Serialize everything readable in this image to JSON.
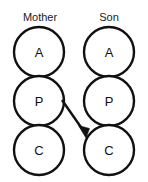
{
  "diagram": {
    "background_color": "#ffffff",
    "stroke_color": "#111111",
    "text_color": "#1a1a1a",
    "columns": [
      {
        "id": "mother",
        "label": "Mother",
        "label_x": 40,
        "label_y": 18,
        "center_x": 39,
        "states": [
          {
            "code": "A",
            "name": "adult",
            "cx": 39,
            "cy": 52,
            "r": 25
          },
          {
            "code": "P",
            "name": "parent",
            "cx": 39,
            "cy": 101,
            "r": 25
          },
          {
            "code": "C",
            "name": "child",
            "cx": 39,
            "cy": 150,
            "r": 25
          }
        ]
      },
      {
        "id": "son",
        "label": "Son",
        "label_x": 109,
        "label_y": 18,
        "center_x": 109,
        "states": [
          {
            "code": "A",
            "name": "adult",
            "cx": 109,
            "cy": 52,
            "r": 25
          },
          {
            "code": "P",
            "name": "parent",
            "cx": 109,
            "cy": 101,
            "r": 25
          },
          {
            "code": "C",
            "name": "child",
            "cx": 109,
            "cy": 150,
            "r": 25
          }
        ]
      }
    ],
    "transactions": [
      {
        "id": "mother-parent-to-son-child",
        "name": "crossed-transaction-arrow",
        "from": "Mother P",
        "to": "Son C",
        "x1": 62,
        "y1": 100,
        "x2": 86,
        "y2": 136,
        "arrowhead_points": "86,138 79,126 89,128",
        "direction": "down-right"
      }
    ]
  }
}
